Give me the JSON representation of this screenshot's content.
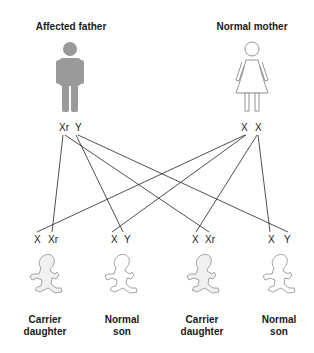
{
  "parents": {
    "father": {
      "label": "Affected father",
      "alleles": [
        "Xr",
        "Y"
      ],
      "color": "#9a9a9a"
    },
    "mother": {
      "label": "Normal mother",
      "alleles": [
        "X",
        "X"
      ],
      "color": "#ffffff"
    }
  },
  "children": [
    {
      "alleles": [
        "X",
        "Xr"
      ],
      "label_line1": "Carrier",
      "label_line2": "daughter"
    },
    {
      "alleles": [
        "X",
        "Y"
      ],
      "label_line1": "Normal",
      "label_line2": "son"
    },
    {
      "alleles": [
        "X",
        "Xr"
      ],
      "label_line1": "Carrier",
      "label_line2": "daughter"
    },
    {
      "alleles": [
        "X",
        "Y"
      ],
      "label_line1": "Normal",
      "label_line2": "son"
    }
  ],
  "colors": {
    "line": "#222222",
    "outline": "#888888",
    "baby_fill": "#f0f0f0"
  }
}
